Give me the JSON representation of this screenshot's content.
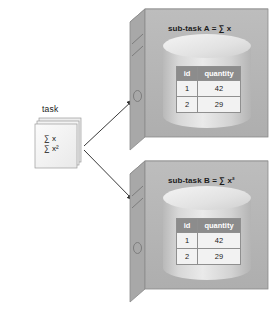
{
  "diagram": {
    "background_color": "#ffffff"
  },
  "task_node": {
    "label": "task",
    "formula_line_1": "∑ x",
    "formula_line_2": "∑ x²",
    "fill_color": "#f0f0f0",
    "edge_color": "#9a9a9a"
  },
  "arrows": [
    {
      "name": "arrow-task-to-subtask-a",
      "from": "task",
      "to": "sub-task A"
    },
    {
      "name": "arrow-task-to-subtask-b",
      "from": "task",
      "to": "sub-task B"
    }
  ],
  "servers": [
    {
      "id": "subtask-a",
      "title": "sub-task A = ∑ x",
      "title_prefix": "sub-task A = ",
      "title_formula": "∑ x",
      "body_color": "#b3b3b3",
      "top_color": "#d3d3d3",
      "side_color": "#a5a5a5",
      "cylinder_color": "#cfcfcf",
      "table": {
        "columns": [
          "id",
          "quantity"
        ],
        "rows": [
          [
            "1",
            "42"
          ],
          [
            "2",
            "29"
          ]
        ],
        "header_bg": "#8c8c8c",
        "header_text_color": "#ffffff",
        "cell_bg": "#f2f2f2"
      },
      "indicator": "disc-ellipse-icon",
      "slots": 2
    },
    {
      "id": "subtask-b",
      "title": "sub-task B = ∑ x²",
      "title_prefix": "sub-task B = ",
      "title_formula": "∑ x²",
      "body_color": "#b3b3b3",
      "top_color": "#d3d3d3",
      "side_color": "#a5a5a5",
      "cylinder_color": "#cfcfcf",
      "table": {
        "columns": [
          "id",
          "quantity"
        ],
        "rows": [
          [
            "1",
            "42"
          ],
          [
            "2",
            "29"
          ]
        ],
        "header_bg": "#8c8c8c",
        "header_text_color": "#ffffff",
        "cell_bg": "#f2f2f2"
      },
      "indicator": "disc-ellipse-icon",
      "slots": 2
    }
  ]
}
